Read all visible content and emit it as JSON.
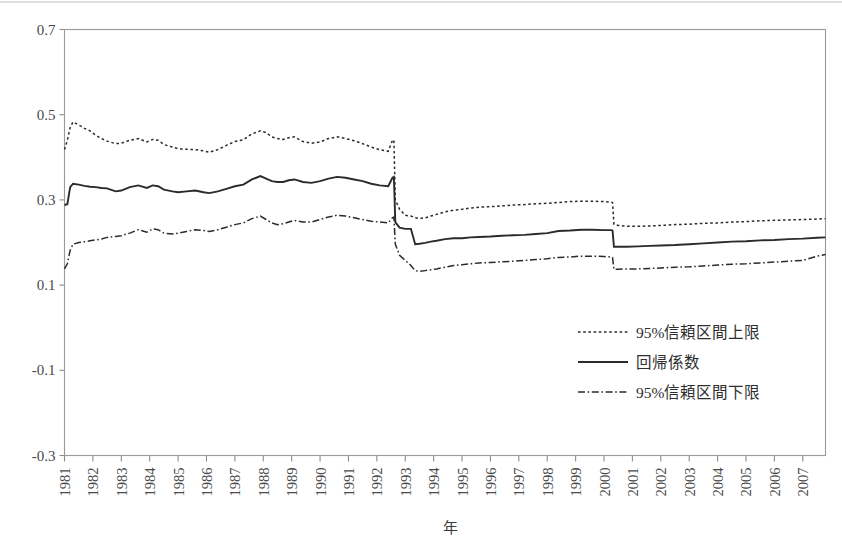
{
  "figure": {
    "background_color": "#ffffff",
    "frame_color": "#9a9a9a",
    "line_color": "#2b2b2b",
    "width": 842,
    "height": 552
  },
  "axes": {
    "x_title": "年",
    "y_ticks": [
      "0.7",
      "0.5",
      "0.3",
      "0.1",
      "-0.1",
      "-0.3"
    ],
    "y_tick_values": [
      0.7,
      0.5,
      0.3,
      0.1,
      -0.1,
      -0.3
    ],
    "x_ticks": [
      "1981",
      "1982",
      "1983",
      "1984",
      "1985",
      "1986",
      "1987",
      "1988",
      "1989",
      "1990",
      "1991",
      "1992",
      "1993",
      "1994",
      "1995",
      "1996",
      "1997",
      "1998",
      "1999",
      "2000",
      "2001",
      "2002",
      "2003",
      "2004",
      "2005",
      "2006",
      "2007"
    ],
    "x_tick_rotation": -90,
    "grid": false
  },
  "legend": {
    "position": "inside-lower-right",
    "items": [
      {
        "label": "95%信頼区間上限",
        "style": "dotted",
        "dash": "2.6,2.6"
      },
      {
        "label": "回帰係数",
        "style": "solid",
        "dash": "none"
      },
      {
        "label": "95%信頼区間下限",
        "style": "dashdot",
        "dash": "7,2.6,1.6,2.6"
      }
    ]
  },
  "chart_data": {
    "type": "line",
    "title": "",
    "subtitle": "",
    "xlabel": "年",
    "ylabel": "",
    "xlim": [
      1981,
      2007.8
    ],
    "ylim": [
      -0.3,
      0.7
    ],
    "grid": false,
    "legend_position": "inside-lower-right",
    "annotations": [
      {
        "text": "structural break",
        "x": 1992.6,
        "kind": "level-shift-down"
      },
      {
        "text": "second level shift",
        "x": 2000.35,
        "kind": "level-shift-down"
      }
    ],
    "x": [
      1981.0,
      1981.1,
      1981.2,
      1981.3,
      1981.5,
      1981.7,
      1981.9,
      1982.1,
      1982.3,
      1982.5,
      1982.8,
      1983.0,
      1983.3,
      1983.6,
      1983.9,
      1984.1,
      1984.3,
      1984.5,
      1984.8,
      1985.0,
      1985.3,
      1985.6,
      1985.9,
      1986.1,
      1986.4,
      1986.7,
      1987.0,
      1987.3,
      1987.6,
      1987.9,
      1988.1,
      1988.3,
      1988.5,
      1988.7,
      1988.9,
      1989.1,
      1989.4,
      1989.7,
      1990.0,
      1990.3,
      1990.6,
      1990.9,
      1991.2,
      1991.5,
      1991.8,
      1992.1,
      1992.4,
      1992.55,
      1992.6,
      1992.65,
      1992.8,
      1993.0,
      1993.2,
      1993.35,
      1993.5,
      1993.7,
      1993.9,
      1994.1,
      1994.4,
      1994.7,
      1995.0,
      1995.3,
      1995.6,
      1996.0,
      1996.4,
      1996.8,
      1997.2,
      1997.6,
      1998.0,
      1998.4,
      1998.8,
      1999.2,
      1999.6,
      2000.0,
      2000.25,
      2000.3,
      2000.35,
      2000.5,
      2000.8,
      2001.2,
      2001.6,
      2002.0,
      2002.5,
      2003.0,
      2003.5,
      2004.0,
      2004.5,
      2005.0,
      2005.5,
      2006.0,
      2006.5,
      2007.0,
      2007.5,
      2007.8
    ],
    "series": [
      {
        "name": "95%信頼区間上限",
        "style": "dotted",
        "values": [
          0.418,
          0.44,
          0.47,
          0.483,
          0.476,
          0.468,
          0.462,
          0.452,
          0.444,
          0.438,
          0.432,
          0.433,
          0.44,
          0.444,
          0.436,
          0.442,
          0.44,
          0.43,
          0.424,
          0.42,
          0.419,
          0.418,
          0.415,
          0.412,
          0.418,
          0.428,
          0.437,
          0.441,
          0.455,
          0.462,
          0.458,
          0.448,
          0.444,
          0.442,
          0.446,
          0.448,
          0.437,
          0.433,
          0.436,
          0.444,
          0.448,
          0.444,
          0.439,
          0.432,
          0.424,
          0.418,
          0.414,
          0.44,
          0.441,
          0.3,
          0.278,
          0.264,
          0.262,
          0.258,
          0.256,
          0.258,
          0.262,
          0.266,
          0.272,
          0.276,
          0.278,
          0.281,
          0.283,
          0.284,
          0.286,
          0.288,
          0.289,
          0.291,
          0.292,
          0.294,
          0.296,
          0.297,
          0.297,
          0.296,
          0.295,
          0.294,
          0.243,
          0.24,
          0.238,
          0.238,
          0.239,
          0.24,
          0.242,
          0.243,
          0.245,
          0.246,
          0.248,
          0.249,
          0.251,
          0.252,
          0.253,
          0.254,
          0.255,
          0.256
        ]
      },
      {
        "name": "回帰係数",
        "style": "solid",
        "values": [
          0.288,
          0.29,
          0.33,
          0.338,
          0.336,
          0.333,
          0.331,
          0.33,
          0.328,
          0.327,
          0.32,
          0.322,
          0.33,
          0.334,
          0.328,
          0.334,
          0.332,
          0.324,
          0.32,
          0.318,
          0.32,
          0.322,
          0.318,
          0.316,
          0.32,
          0.326,
          0.332,
          0.336,
          0.348,
          0.356,
          0.35,
          0.344,
          0.342,
          0.342,
          0.346,
          0.348,
          0.342,
          0.34,
          0.344,
          0.35,
          0.354,
          0.352,
          0.348,
          0.344,
          0.338,
          0.334,
          0.332,
          0.352,
          0.354,
          0.248,
          0.235,
          0.232,
          0.232,
          0.196,
          0.197,
          0.199,
          0.202,
          0.204,
          0.208,
          0.21,
          0.21,
          0.212,
          0.213,
          0.214,
          0.216,
          0.217,
          0.218,
          0.22,
          0.222,
          0.227,
          0.228,
          0.23,
          0.23,
          0.229,
          0.229,
          0.228,
          0.19,
          0.19,
          0.19,
          0.191,
          0.192,
          0.193,
          0.194,
          0.196,
          0.198,
          0.2,
          0.202,
          0.203,
          0.205,
          0.206,
          0.208,
          0.209,
          0.211,
          0.212
        ]
      },
      {
        "name": "95%信頼区間下限",
        "style": "dashdot",
        "values": [
          0.138,
          0.15,
          0.182,
          0.196,
          0.2,
          0.202,
          0.204,
          0.206,
          0.208,
          0.212,
          0.214,
          0.216,
          0.222,
          0.23,
          0.224,
          0.232,
          0.23,
          0.222,
          0.22,
          0.222,
          0.226,
          0.23,
          0.228,
          0.226,
          0.23,
          0.236,
          0.242,
          0.246,
          0.256,
          0.262,
          0.254,
          0.246,
          0.242,
          0.244,
          0.248,
          0.252,
          0.248,
          0.248,
          0.254,
          0.26,
          0.264,
          0.262,
          0.258,
          0.254,
          0.25,
          0.248,
          0.246,
          0.258,
          0.26,
          0.196,
          0.17,
          0.158,
          0.146,
          0.134,
          0.132,
          0.134,
          0.136,
          0.138,
          0.142,
          0.146,
          0.148,
          0.15,
          0.152,
          0.153,
          0.155,
          0.156,
          0.158,
          0.16,
          0.162,
          0.165,
          0.166,
          0.168,
          0.168,
          0.167,
          0.166,
          0.165,
          0.137,
          0.137,
          0.138,
          0.138,
          0.139,
          0.14,
          0.142,
          0.143,
          0.145,
          0.147,
          0.149,
          0.15,
          0.152,
          0.154,
          0.156,
          0.158,
          0.168,
          0.172
        ]
      }
    ]
  }
}
